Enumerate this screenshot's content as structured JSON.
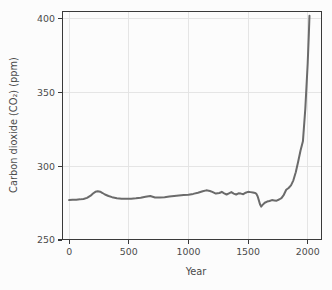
{
  "chart_data": {
    "type": "line",
    "title": "",
    "xlabel": "Year",
    "ylabel": "Carbon dioxide (CO₂) (ppm)",
    "xlim": [
      -60,
      2120
    ],
    "ylim": [
      250,
      405
    ],
    "xticks": [
      0,
      500,
      1000,
      1500,
      2000
    ],
    "yticks": [
      250,
      300,
      350,
      400
    ],
    "xtick_labels": [
      "0",
      "500",
      "1000",
      "1500",
      "2000"
    ],
    "ytick_labels": [
      "250",
      "300",
      "350",
      "400"
    ],
    "grid": "horizontal-and-vertical",
    "legend": "none",
    "series": [
      {
        "name": "Atmospheric CO2 concentration",
        "color": "#6b6b6b",
        "x": [
          0,
          30,
          60,
          90,
          120,
          150,
          180,
          200,
          220,
          240,
          260,
          280,
          300,
          330,
          360,
          400,
          440,
          480,
          520,
          560,
          600,
          640,
          680,
          700,
          720,
          760,
          800,
          840,
          880,
          920,
          960,
          1000,
          1040,
          1080,
          1120,
          1150,
          1180,
          1200,
          1230,
          1260,
          1280,
          1300,
          1320,
          1340,
          1360,
          1380,
          1400,
          1420,
          1440,
          1460,
          1480,
          1500,
          1520,
          1540,
          1560,
          1570,
          1580,
          1590,
          1600,
          1610,
          1620,
          1640,
          1660,
          1680,
          1700,
          1720,
          1740,
          1760,
          1780,
          1800,
          1820,
          1840,
          1860,
          1880,
          1900,
          1920,
          1940,
          1960,
          1980,
          2000,
          2010,
          2015
        ],
        "y": [
          277.0,
          277.2,
          277.3,
          277.5,
          277.8,
          278.5,
          280.0,
          281.5,
          282.6,
          283.0,
          282.7,
          281.8,
          280.8,
          279.8,
          279.0,
          278.3,
          278.0,
          277.9,
          278.0,
          278.2,
          278.6,
          279.3,
          279.8,
          279.3,
          278.8,
          278.7,
          279.0,
          279.4,
          279.8,
          280.1,
          280.4,
          280.6,
          281.2,
          282.0,
          283.0,
          283.6,
          283.2,
          282.6,
          281.4,
          281.8,
          282.6,
          281.6,
          280.8,
          281.6,
          282.4,
          281.4,
          280.8,
          281.6,
          281.4,
          281.0,
          282.0,
          282.6,
          282.4,
          282.1,
          281.8,
          281.2,
          279.6,
          277.0,
          274.2,
          272.6,
          273.6,
          275.2,
          276.0,
          276.4,
          277.0,
          276.8,
          276.6,
          277.4,
          278.4,
          280.6,
          284.0,
          285.2,
          287.0,
          290.4,
          295.8,
          303.0,
          310.6,
          316.8,
          338.8,
          369.5,
          390.0,
          401.8
        ]
      }
    ]
  },
  "axes": {
    "y_axis_title": "Carbon dioxide (CO₂) (ppm)",
    "x_axis_title": "Year"
  }
}
